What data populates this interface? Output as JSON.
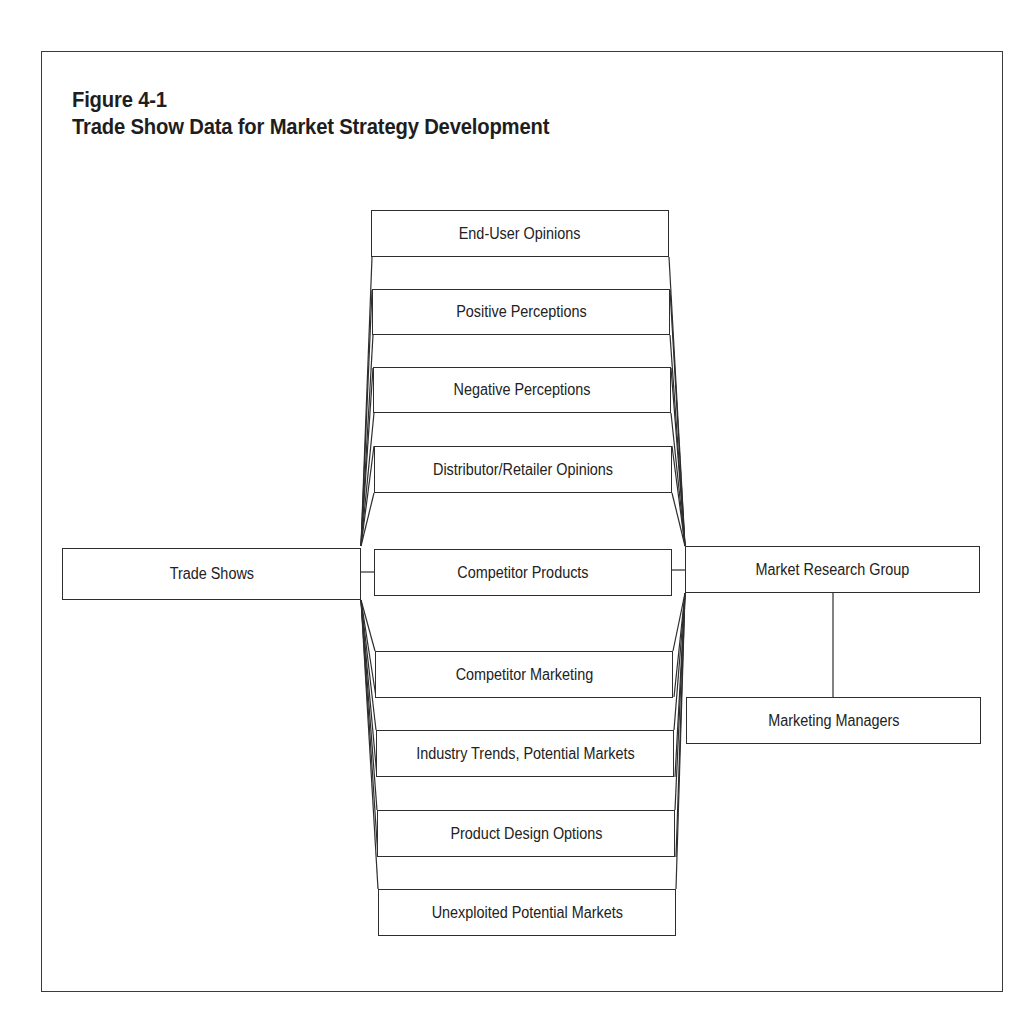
{
  "figure": {
    "label": "Figure 4-1",
    "title": "Trade Show Data for Market Strategy Development"
  },
  "source_node": {
    "label": "Trade Shows"
  },
  "data_nodes": [
    {
      "label": "End-User Opinions"
    },
    {
      "label": "Positive Perceptions"
    },
    {
      "label": "Negative Perceptions"
    },
    {
      "label": "Distributor/Retailer Opinions"
    },
    {
      "label": "Competitor Products"
    },
    {
      "label": "Competitor Marketing"
    },
    {
      "label": "Industry Trends, Potential Markets"
    },
    {
      "label": "Product Design Options"
    },
    {
      "label": "Unexploited Potential Markets"
    }
  ],
  "destination_nodes": [
    {
      "label": "Market Research Group"
    },
    {
      "label": "Marketing Managers"
    }
  ],
  "flow": [
    {
      "from": "Trade Shows",
      "to": "all data nodes"
    },
    {
      "from": "all data nodes",
      "to": "Market Research Group"
    },
    {
      "from": "Market Research Group",
      "to": "Marketing Managers"
    }
  ]
}
